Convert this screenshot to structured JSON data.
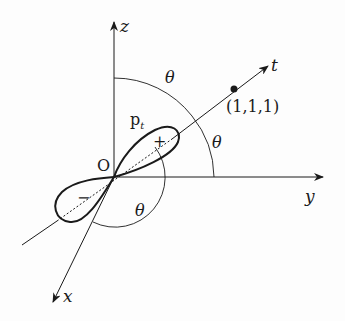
{
  "diagram": {
    "axes": {
      "z": {
        "label": "z"
      },
      "y": {
        "label": "y"
      },
      "x": {
        "label": "x"
      },
      "t": {
        "label": "t"
      }
    },
    "origin_label": "O",
    "point_label": "(1,1,1)",
    "orbital_label": "p",
    "orbital_subscript": "t",
    "positive_lobe_sign": "+",
    "negative_lobe_sign": "−",
    "angle_labels": [
      "θ",
      "θ",
      "θ"
    ],
    "colors": {
      "ink": "#1a1a1a",
      "background": "#fdfdfd"
    }
  }
}
